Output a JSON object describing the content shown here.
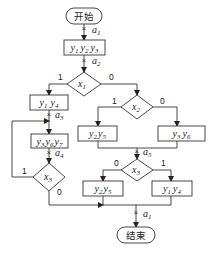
{
  "diagram": {
    "type": "flowchart",
    "start": {
      "label": "开始"
    },
    "end": {
      "label": "结束"
    },
    "operations": [
      {
        "id": "op1",
        "vars": [
          {
            "b": "y",
            "s": "1"
          },
          {
            "b": "y",
            "s": "2"
          },
          {
            "b": "y",
            "s": "3"
          }
        ]
      },
      {
        "id": "op2",
        "vars": [
          {
            "b": "y",
            "s": "1"
          },
          {
            "b": "y",
            "s": "4"
          }
        ]
      },
      {
        "id": "op3",
        "vars": [
          {
            "b": "y",
            "s": "3"
          },
          {
            "b": "y",
            "s": "6"
          },
          {
            "b": "y",
            "s": "7"
          }
        ]
      },
      {
        "id": "op4",
        "vars": [
          {
            "b": "y",
            "s": "2"
          },
          {
            "b": "y",
            "s": "5"
          }
        ]
      },
      {
        "id": "op5",
        "vars": [
          {
            "b": "y",
            "s": "3"
          },
          {
            "b": "y",
            "s": "6"
          }
        ]
      },
      {
        "id": "op6",
        "vars": [
          {
            "b": "y",
            "s": "2"
          },
          {
            "b": "y",
            "s": "5"
          }
        ]
      },
      {
        "id": "op7",
        "vars": [
          {
            "b": "y",
            "s": "1"
          },
          {
            "b": "y",
            "s": "4"
          }
        ]
      }
    ],
    "conditions": [
      {
        "id": "c1",
        "base": "x",
        "sub": "1",
        "true_label": "1",
        "false_label": "0"
      },
      {
        "id": "c2",
        "base": "x",
        "sub": "2",
        "true_label": "1",
        "false_label": "0"
      },
      {
        "id": "c3",
        "base": "x",
        "sub": "3",
        "true_label": "1",
        "false_label": "0"
      },
      {
        "id": "c4",
        "base": "x",
        "sub": "3",
        "true_label": "1",
        "false_label": "0"
      }
    ],
    "states": [
      {
        "id": "s1",
        "base": "a",
        "sub": "1"
      },
      {
        "id": "s2",
        "base": "a",
        "sub": "2"
      },
      {
        "id": "s3",
        "base": "a",
        "sub": "3"
      },
      {
        "id": "s4",
        "base": "a",
        "sub": "4"
      },
      {
        "id": "s5",
        "base": "a",
        "sub": "5"
      },
      {
        "id": "s6",
        "base": "a",
        "sub": "1"
      }
    ],
    "cross_mark": "×"
  }
}
